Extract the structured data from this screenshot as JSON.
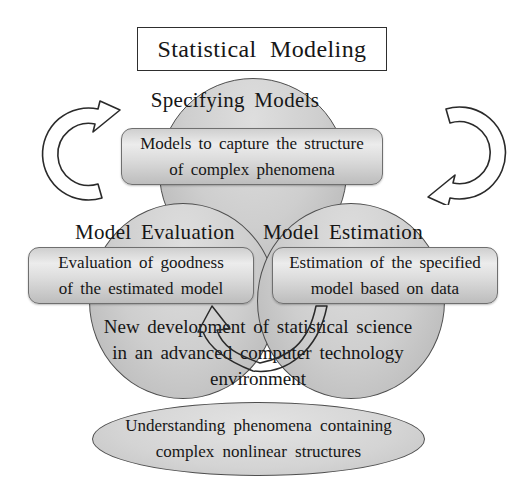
{
  "title": "Statistical Modeling",
  "cycle": {
    "specifying": {
      "label": "Specifying Models",
      "note": "Models to capture the structure\nof complex phenomena"
    },
    "evaluation": {
      "label": "Model Evaluation",
      "note": "Evaluation of goodness\nof the estimated model"
    },
    "estimation": {
      "label": "Model Estimation",
      "note": "Estimation of the specified\nmodel based on data"
    }
  },
  "center_note": "New development of statistical science\nin an advanced computer technology\nenvironment",
  "outcome": "Understanding phenomena containing\ncomplex nonlinear structures",
  "icons": {
    "left_arrow": "curved-cycle-up-arrow-icon",
    "right_arrow": "curved-cycle-down-arrow-icon",
    "center_arrow": "u-turn-up-arrow-icon"
  },
  "colors": {
    "background": "#ffffff",
    "circle_fill": "#cecece",
    "box_fill": "#dcdcdc",
    "outline": "#4e4e4e",
    "text": "#161616"
  }
}
